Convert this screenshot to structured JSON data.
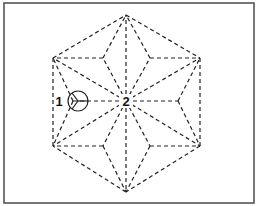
{
  "diagram": {
    "type": "fold-pattern",
    "frame": {
      "x": 4,
      "y": 3,
      "width": 250,
      "height": 200,
      "stroke": "#555555"
    },
    "line_color": "#222222",
    "center": {
      "x": 126,
      "y": 101
    },
    "hexagon": [
      [
        126,
        15
      ],
      [
        200,
        58
      ],
      [
        200,
        146
      ],
      [
        126,
        192
      ],
      [
        53,
        146
      ],
      [
        53,
        58
      ]
    ],
    "inner_points": [
      [
        103,
        58
      ],
      [
        150,
        58
      ],
      [
        178,
        101
      ],
      [
        150,
        146
      ],
      [
        103,
        146
      ],
      [
        73,
        101
      ]
    ],
    "labels": [
      {
        "id": "1",
        "text": "1",
        "x": 59,
        "y": 106
      },
      {
        "id": "2",
        "text": "2",
        "x": 126,
        "y": 106
      }
    ],
    "marker": {
      "type": "circle-with-y-lines",
      "cx": 78,
      "cy": 101,
      "r": 10,
      "label": "1"
    }
  }
}
